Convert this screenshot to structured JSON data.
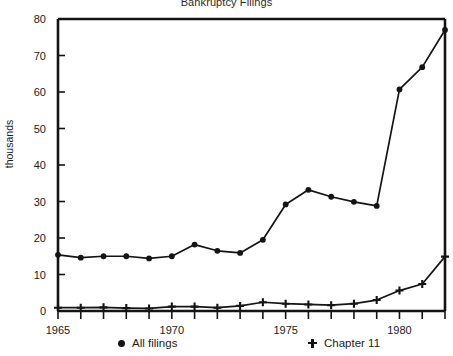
{
  "chart_data": {
    "type": "line",
    "title": "Bankruptcy Filings",
    "xlabel": "",
    "ylabel": "thousands",
    "xlim": [
      1965,
      1982
    ],
    "ylim": [
      0,
      80
    ],
    "grid": false,
    "legend_position": "bottom",
    "x": [
      1965,
      1966,
      1967,
      1968,
      1969,
      1970,
      1971,
      1972,
      1973,
      1974,
      1975,
      1976,
      1977,
      1978,
      1979,
      1980,
      1981,
      1982
    ],
    "xtick_labels": [
      "1965",
      "1970",
      "1975",
      "1980"
    ],
    "xtick_values": [
      1965,
      1970,
      1975,
      1980
    ],
    "ytick_labels": [
      "0",
      "10",
      "20",
      "30",
      "40",
      "50",
      "60",
      "70",
      "80"
    ],
    "ytick_values": [
      0,
      10,
      20,
      30,
      40,
      50,
      60,
      70,
      80
    ],
    "series": [
      {
        "name": "All filings",
        "marker": "circle",
        "values": [
          15.4,
          14.6,
          15.0,
          15.0,
          14.4,
          15.0,
          18.2,
          16.5,
          15.9,
          19.5,
          29.2,
          33.2,
          31.3,
          29.9,
          28.8,
          60.7,
          66.8,
          77.0
        ]
      },
      {
        "name": "Chapter 11",
        "marker": "plus",
        "values": [
          0.9,
          0.9,
          1.0,
          0.8,
          0.7,
          1.2,
          1.2,
          0.9,
          1.4,
          2.4,
          2.0,
          1.8,
          1.6,
          2.0,
          3.0,
          5.6,
          7.4,
          14.9
        ]
      }
    ]
  },
  "legend": {
    "entries": [
      {
        "label": "All filings",
        "marker": "circle-marker-icon"
      },
      {
        "label": "Chapter 11",
        "marker": "plus-marker-icon"
      }
    ]
  }
}
